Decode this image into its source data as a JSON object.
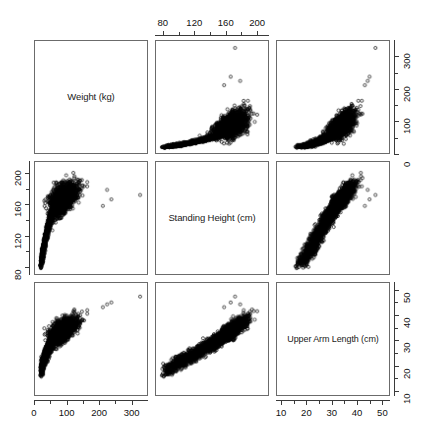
{
  "figure": {
    "type": "scatterplot-matrix",
    "background": "#ffffff",
    "marker": "open-circle",
    "marker_color": "#000000",
    "frame_color": "#6b6b6b"
  },
  "variables": [
    {
      "key": "weight",
      "label": "Weight (kg)",
      "unit": "kg",
      "min": 0,
      "max": 350
    },
    {
      "key": "height",
      "label": "Standing Height (cm)",
      "unit": "cm",
      "min": 70,
      "max": 215
    },
    {
      "key": "arm",
      "label": "Upper Arm Length (cm)",
      "unit": "cm",
      "min": 8,
      "max": 53
    }
  ],
  "diagonal_labels": [
    "Weight (kg)",
    "Standing Height (cm)",
    "Upper Arm Length (cm)"
  ],
  "axes": [
    {
      "name": "top-axis-height",
      "position": "top",
      "ticks": [
        80,
        120,
        160,
        200
      ],
      "minor_ticks": [
        100,
        140,
        180
      ]
    },
    {
      "name": "right-axis-weight",
      "position": "right",
      "ticks": [
        0,
        100,
        200,
        300
      ],
      "minor_ticks": [
        50,
        150,
        250
      ]
    },
    {
      "name": "left-axis-height",
      "position": "left",
      "ticks": [
        200,
        160,
        120,
        80
      ],
      "minor_ticks": [
        180,
        140,
        100
      ]
    },
    {
      "name": "right-axis-arm",
      "position": "right",
      "ticks": [
        50,
        40,
        30,
        20,
        10
      ],
      "minor_ticks": [
        45,
        35,
        25,
        15
      ]
    },
    {
      "name": "bottom-axis-weight",
      "position": "bottom",
      "ticks": [
        0,
        100,
        200,
        300
      ],
      "minor_ticks": [
        50,
        150,
        250
      ]
    },
    {
      "name": "bottom-axis-arm",
      "position": "bottom",
      "ticks": [
        10,
        20,
        30,
        40,
        50
      ],
      "minor_ticks": [
        15,
        25,
        35,
        45
      ]
    }
  ],
  "chart_data": {
    "type": "scatter",
    "title": "",
    "subtitle": "",
    "layout": "3x3 scatterplot matrix (pairs plot), diagonal shows variable names",
    "grid": false,
    "legend": "none",
    "variables": [
      "Weight (kg)",
      "Standing Height (cm)",
      "Upper Arm Length (cm)"
    ],
    "axis_ranges": {
      "weight": [
        0,
        350
      ],
      "height": [
        70,
        215
      ],
      "arm": [
        8,
        53
      ]
    },
    "tick_labels": {
      "weight": [
        0,
        100,
        200,
        300
      ],
      "height": [
        80,
        120,
        160,
        200
      ],
      "arm": [
        10,
        20,
        30,
        40,
        50
      ]
    },
    "panels": [
      {
        "row": 1,
        "col": 1,
        "kind": "diagonal",
        "label": "Weight (kg)"
      },
      {
        "row": 1,
        "col": 2,
        "kind": "scatter",
        "x": "Standing Height (cm)",
        "y": "Weight (kg)",
        "xaxis_side": "top",
        "description": "Dense comma/teardrop cloud; weight increases and fans out with height; outliers near 300+ kg",
        "n": 4000,
        "correlation": 0.55
      },
      {
        "row": 1,
        "col": 3,
        "kind": "scatter",
        "x": "Upper Arm Length (cm)",
        "y": "Weight (kg)",
        "yaxis_side": "right",
        "description": "Teardrop cloud; weight rises steeply with arm length; high outlier near top",
        "n": 4000,
        "correlation": 0.8
      },
      {
        "row": 2,
        "col": 1,
        "kind": "scatter",
        "x": "Weight (kg)",
        "y": "Standing Height (cm)",
        "yaxis_side": "left",
        "description": "Steep rise then plateau near 175 cm; isolated point at far right",
        "n": 4000,
        "correlation": 0.55
      },
      {
        "row": 2,
        "col": 2,
        "kind": "diagonal",
        "label": "Standing Height (cm)"
      },
      {
        "row": 2,
        "col": 3,
        "kind": "scatter",
        "x": "Upper Arm Length (cm)",
        "y": "Standing Height (cm)",
        "description": "Strong tight linear band along the diagonal",
        "n": 4000,
        "correlation": 0.92
      },
      {
        "row": 3,
        "col": 1,
        "kind": "scatter",
        "x": "Weight (kg)",
        "y": "Upper Arm Length (cm)",
        "xaxis_side": "bottom",
        "description": "Steep rise then flattening near 40 cm; isolated point at far right",
        "n": 4000,
        "correlation": 0.8
      },
      {
        "row": 3,
        "col": 2,
        "kind": "scatter",
        "x": "Standing Height (cm)",
        "y": "Upper Arm Length (cm)",
        "xaxis_side": "bottom",
        "description": "Strong tight linear band along the diagonal",
        "n": 4000,
        "correlation": 0.92
      },
      {
        "row": 3,
        "col": 3,
        "kind": "diagonal",
        "label": "Upper Arm Length (cm)"
      }
    ]
  }
}
